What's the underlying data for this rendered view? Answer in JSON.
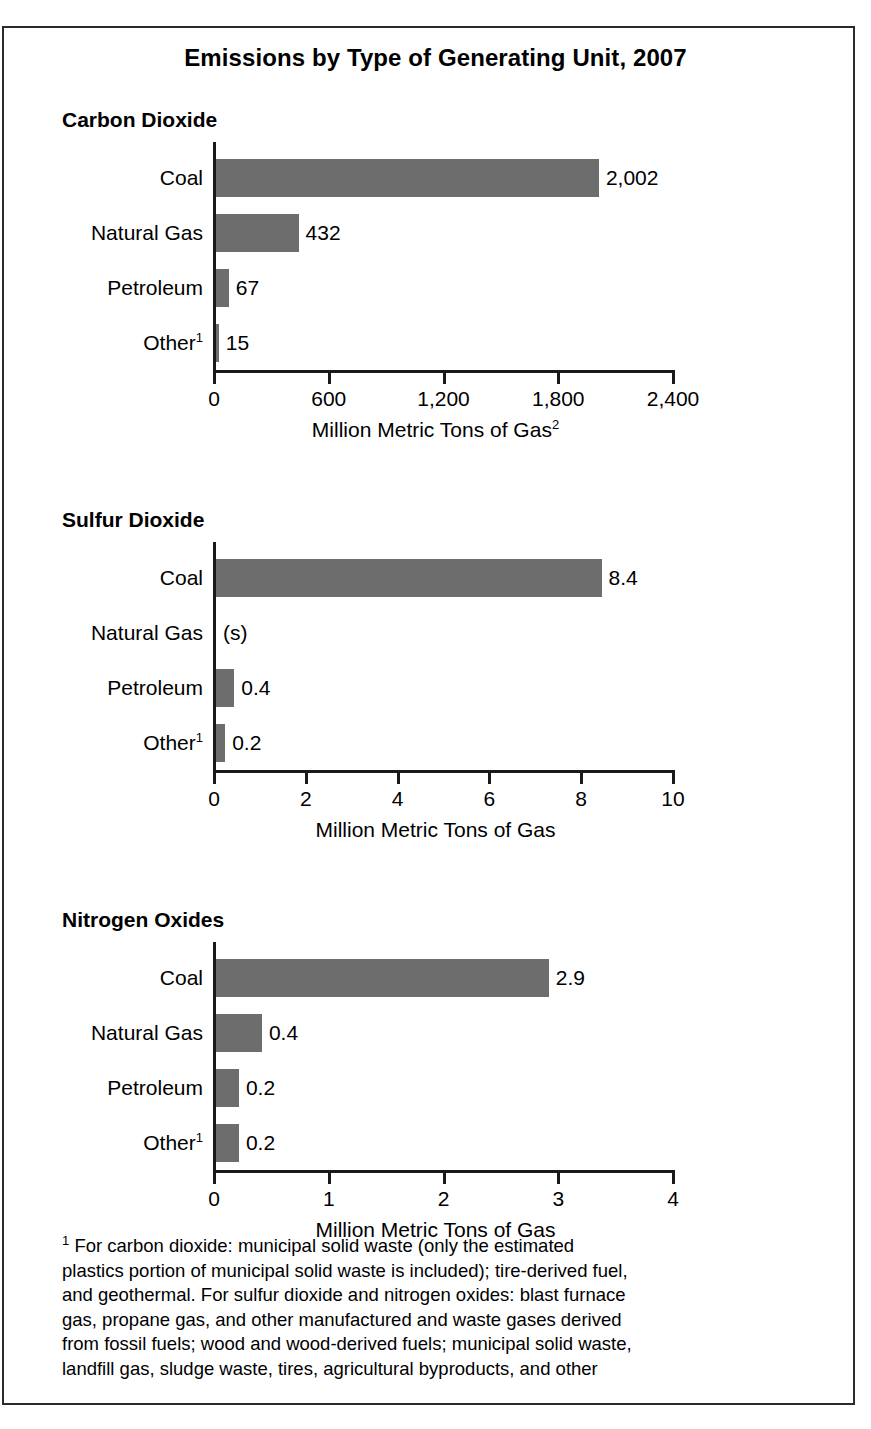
{
  "figure": {
    "title": "Emissions by Type of Generating Unit, 2007",
    "footnote_marker": "1",
    "footnote_lines": [
      "For carbon dioxide: municipal solid waste (only the estimated",
      "plastics portion of municipal solid waste is included); tire-derived fuel,",
      "and geothermal. For sulfur dioxide and nitrogen oxides: blast furnace",
      "gas, propane gas, and other manufactured and waste gases derived",
      "from fossil fuels; wood and wood-derived fuels; municipal solid waste,",
      "landfill gas, sludge waste, tires, agricultural byproducts, and other"
    ],
    "bar_color": "#6d6d6d",
    "border_color": "#2b2b2b"
  },
  "chart_data": [
    {
      "type": "bar",
      "title": "Carbon Dioxide",
      "orientation": "horizontal",
      "categories": [
        "Coal",
        "Natural Gas",
        "Petroleum",
        "Other"
      ],
      "category_footnotes": [
        "",
        "",
        "",
        "1"
      ],
      "values": [
        2002,
        432,
        67,
        15
      ],
      "data_labels": [
        "2,002",
        "432",
        "67",
        "15"
      ],
      "xlabel": "Million Metric Tons of Gas",
      "xlabel_footnote": "2",
      "ylabel": "",
      "xlim": [
        0,
        2400
      ],
      "xticks": [
        0,
        600,
        1200,
        1800,
        2400
      ],
      "xticklabels": [
        "0",
        "600",
        "1,200",
        "1,800",
        "2,400"
      ],
      "grid": false,
      "legend": "none"
    },
    {
      "type": "bar",
      "title": "Sulfur Dioxide",
      "orientation": "horizontal",
      "categories": [
        "Coal",
        "Natural Gas",
        "Petroleum",
        "Other"
      ],
      "category_footnotes": [
        "",
        "",
        "",
        "1"
      ],
      "values": [
        8.4,
        0,
        0.4,
        0.2
      ],
      "data_labels": [
        "8.4",
        "(s)",
        "0.4",
        "0.2"
      ],
      "xlabel": "Million Metric Tons of Gas",
      "xlabel_footnote": "",
      "ylabel": "",
      "xlim": [
        0,
        10
      ],
      "xticks": [
        0,
        2,
        4,
        6,
        8,
        10
      ],
      "xticklabels": [
        "0",
        "2",
        "4",
        "6",
        "8",
        "10"
      ],
      "grid": false,
      "legend": "none"
    },
    {
      "type": "bar",
      "title": "Nitrogen Oxides",
      "orientation": "horizontal",
      "categories": [
        "Coal",
        "Natural Gas",
        "Petroleum",
        "Other"
      ],
      "category_footnotes": [
        "",
        "",
        "",
        "1"
      ],
      "values": [
        2.9,
        0.4,
        0.2,
        0.2
      ],
      "data_labels": [
        "2.9",
        "0.4",
        "0.2",
        "0.2"
      ],
      "xlabel": "Million Metric Tons of Gas",
      "xlabel_footnote": "",
      "ylabel": "",
      "xlim": [
        0,
        4
      ],
      "xticks": [
        0,
        1,
        2,
        3,
        4
      ],
      "xticklabels": [
        "0",
        "1",
        "2",
        "3",
        "4"
      ],
      "grid": false,
      "legend": "none"
    }
  ]
}
